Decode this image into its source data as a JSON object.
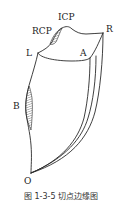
{
  "figure": {
    "labels": {
      "icp": "ICP",
      "rcp": "RCP",
      "r": "R",
      "l": "L",
      "a": "A",
      "b": "B",
      "o": "O"
    },
    "caption": "图 1-3-5 切点边缘图",
    "colors": {
      "stroke": "#2a2a2a",
      "background": "#ffffff"
    }
  }
}
